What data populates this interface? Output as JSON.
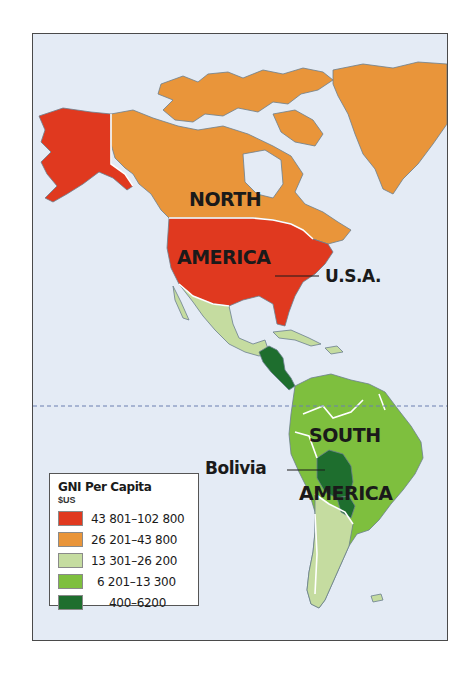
{
  "map": {
    "title": "GNI Per Capita",
    "labels": {
      "north_america_line1": "NORTH",
      "north_america_line2": "AMERICA",
      "south_america_line1": "SOUTH",
      "south_america_line2": "AMERICA",
      "usa": "U.S.A.",
      "bolivia": "Bolivia"
    },
    "equator_line": "dashed"
  },
  "legend": {
    "title": "GNI Per Capita",
    "unit": "$US",
    "items": [
      {
        "range": "43 801–102 800",
        "color": "#e0391f"
      },
      {
        "range": "26 201–43 800",
        "color": "#e9953a"
      },
      {
        "range": "13 301–26 200",
        "color": "#c5dca0"
      },
      {
        "range": "6 201–13 300",
        "color": "#7ebf3e"
      },
      {
        "range": "400–6200",
        "color": "#1e6e2e"
      }
    ]
  },
  "colors": {
    "ocean": "#e4ebf5",
    "high": "#e0391f",
    "upper_mid": "#e9953a",
    "mid": "#c5dca0",
    "lower_mid": "#7ebf3e",
    "low": "#1e6e2e",
    "border": "#ffffff",
    "coast": "#6b7f8e"
  }
}
